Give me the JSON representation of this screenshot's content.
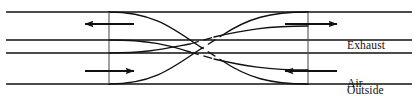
{
  "figure": {
    "type": "air-to-air-heat-exchanger-schematic",
    "width": 418,
    "height": 96,
    "background_color": "#ffffff",
    "line_color": "#111111"
  },
  "labels": {
    "exhaust_air": "Exhaust\nAir",
    "exhaust_air_line1": "Exhaust",
    "exhaust_air_line2": "Air",
    "outside_air": "Outside\nAir",
    "outside_air_line1": "Outside",
    "outside_air_line2": "Air"
  },
  "flow": {
    "exhaust_direction": "right",
    "outside_direction": "left",
    "left_top_arrow_direction": "left",
    "left_bottom_arrow_direction": "right",
    "right_top_arrow_direction": "right",
    "right_bottom_arrow_direction": "left"
  },
  "geometry": {
    "duct_lines_y": [
      12,
      40,
      53,
      84
    ],
    "vertical_boundaries_x": [
      109,
      308
    ],
    "left_edge_x": 6,
    "right_edge_x": 412
  }
}
